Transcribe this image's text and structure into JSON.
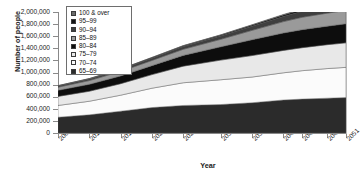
{
  "chart_data": {
    "type": "area",
    "stacked": true,
    "title": "",
    "xlabel": "Year",
    "ylabel": "Number of people",
    "ylim": [
      0,
      2000000
    ],
    "ytick_labels": [
      "2,000,000",
      "1,800,000",
      "1,600,000",
      "1,400,000",
      "1,200,000",
      "1,000,000",
      "800,000",
      "600,000",
      "400,000",
      "200,000",
      "0"
    ],
    "ytick_values": [
      2000000,
      1800000,
      1600000,
      1400000,
      1200000,
      1000000,
      800000,
      600000,
      400000,
      200000,
      0
    ],
    "grid": false,
    "legend_position": "top-left",
    "xlim": [
      2005,
      2051
    ],
    "xtick_labels": [
      "2005",
      "2010",
      "2015",
      "2020",
      "2025",
      "2031",
      "2036",
      "2041",
      "2044",
      "2048",
      "2051"
    ],
    "xtick_values": [
      2005,
      2010,
      2015,
      2020,
      2025,
      2031,
      2036,
      2041,
      2044,
      2048,
      2051
    ],
    "x": [
      2005,
      2010,
      2015,
      2020,
      2025,
      2031,
      2036,
      2041,
      2044,
      2048,
      2051
    ],
    "series": [
      {
        "name": "65–69",
        "color": "#2b2b2b",
        "values": [
          260000,
          300000,
          360000,
          420000,
          455000,
          470000,
          500000,
          545000,
          560000,
          575000,
          585000
        ]
      },
      {
        "name": "70–74",
        "color": "#fbfbfb",
        "values": [
          195000,
          225000,
          265000,
          320000,
          375000,
          410000,
          425000,
          450000,
          470000,
          490000,
          500000
        ]
      },
      {
        "name": "75–79",
        "color": "#e8e8e8",
        "values": [
          150000,
          165000,
          190000,
          225000,
          275000,
          325000,
          355000,
          370000,
          380000,
          395000,
          405000
        ]
      },
      {
        "name": "80–84",
        "color": "#0d0d0d",
        "values": [
          100000,
          115000,
          128000,
          148000,
          178000,
          220000,
          262000,
          288000,
          298000,
          306000,
          315000
        ]
      },
      {
        "name": "85–89",
        "color": "#9a9a9a",
        "values": [
          52000,
          62000,
          74000,
          86000,
          101000,
          124000,
          155000,
          188000,
          205000,
          215000,
          222000
        ]
      },
      {
        "name": "90–94",
        "color": "#3f3f3f",
        "values": [
          20000,
          25000,
          31000,
          38000,
          45000,
          55000,
          68000,
          86000,
          98000,
          110000,
          118000
        ]
      },
      {
        "name": "95–99",
        "color": "#141414",
        "values": [
          5000,
          6500,
          8000,
          10000,
          12500,
          15500,
          19500,
          25000,
          29000,
          33000,
          36000
        ]
      },
      {
        "name": "100 & over",
        "color": "#6b6b6b",
        "values": [
          1000,
          1400,
          1900,
          2600,
          3400,
          4500,
          6000,
          8000,
          9500,
          11000,
          12500
        ]
      }
    ],
    "legend_entries": [
      {
        "label": "100 & over",
        "swatch": "#6b6b6b"
      },
      {
        "label": "95–99",
        "swatch": "#141414"
      },
      {
        "label": "90–94",
        "swatch": "#3f3f3f"
      },
      {
        "label": "85–89",
        "swatch": "#9a9a9a"
      },
      {
        "label": "80–84",
        "swatch": "#0d0d0d"
      },
      {
        "label": "75–79",
        "swatch": "#e8e8e8"
      },
      {
        "label": "70–74",
        "swatch": "#fbfbfb"
      },
      {
        "label": "65–69",
        "swatch": "#2b2b2b"
      }
    ]
  }
}
